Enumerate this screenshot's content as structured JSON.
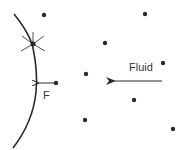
{
  "diagram": {
    "type": "physics-schematic",
    "labels": {
      "fluid": "Fluid",
      "force": "F"
    },
    "colors": {
      "stroke": "#2a2a2a",
      "dot": "#2a2a2a",
      "text": "#333333",
      "background": "#ffffff"
    },
    "particles": [
      {
        "x": 44,
        "y": 15
      },
      {
        "x": 145,
        "y": 14
      },
      {
        "x": 105,
        "y": 43
      },
      {
        "x": 163,
        "y": 63
      },
      {
        "x": 86,
        "y": 74
      },
      {
        "x": 56,
        "y": 83
      },
      {
        "x": 134,
        "y": 100
      },
      {
        "x": 85,
        "y": 120
      },
      {
        "x": 173,
        "y": 129
      }
    ],
    "impact_point": {
      "x": 33,
      "y": 44
    },
    "fluid_arrow": {
      "from": {
        "x": 162,
        "y": 81
      },
      "to": {
        "x": 113,
        "y": 81
      },
      "direction": "left"
    },
    "force_arrow": {
      "from": {
        "x": 56,
        "y": 83
      },
      "to": {
        "x": 37,
        "y": 83
      },
      "direction": "left"
    }
  }
}
